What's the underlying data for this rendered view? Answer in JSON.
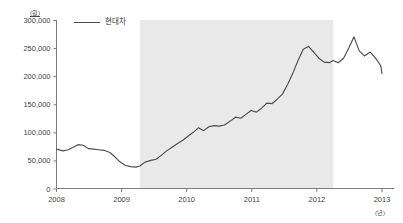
{
  "chart_data": {
    "type": "line",
    "title": "",
    "xlabel": "(년)",
    "ylabel": "(원)",
    "y_unit": "(원)",
    "x_unit": "(년)",
    "xlim": [
      2008.0,
      2013.0
    ],
    "ylim": [
      0,
      300000
    ],
    "grid": false,
    "legend_position": "top-left",
    "legend": [
      "현대차"
    ],
    "y_ticks": [
      0,
      50000,
      100000,
      150000,
      200000,
      250000,
      300000
    ],
    "y_tick_labels": [
      "0",
      "50,000",
      "100,000",
      "150,000",
      "200,000",
      "250,000",
      "300,000"
    ],
    "x_ticks": [
      2008,
      2009,
      2010,
      2011,
      2012,
      2013
    ],
    "x_tick_labels": [
      "2008",
      "2009",
      "2010",
      "2011",
      "2012",
      "2013"
    ],
    "shaded_band": {
      "label": "",
      "x_start": 2009.28,
      "x_end": 2012.25,
      "color": "#e9e9e9"
    },
    "series": [
      {
        "name": "현대차",
        "color": "#4d4d4d",
        "x": [
          2008.0,
          2008.1,
          2008.18,
          2008.25,
          2008.33,
          2008.41,
          2008.49,
          2008.57,
          2008.65,
          2008.73,
          2008.82,
          2008.9,
          2008.98,
          2009.06,
          2009.14,
          2009.22,
          2009.28,
          2009.36,
          2009.45,
          2009.53,
          2009.61,
          2009.69,
          2009.77,
          2009.86,
          2009.94,
          2010.02,
          2010.1,
          2010.18,
          2010.26,
          2010.34,
          2010.42,
          2010.5,
          2010.58,
          2010.67,
          2010.75,
          2010.83,
          2010.91,
          2010.99,
          2011.07,
          2011.15,
          2011.23,
          2011.31,
          2011.39,
          2011.47,
          2011.55,
          2011.63,
          2011.71,
          2011.79,
          2011.87,
          2011.95,
          2012.03,
          2012.11,
          2012.19,
          2012.25,
          2012.33,
          2012.41,
          2012.49,
          2012.57,
          2012.65,
          2012.73,
          2012.82,
          2012.9,
          2012.98,
          2013.0
        ],
        "values": [
          70000,
          67000,
          69000,
          73000,
          78000,
          77000,
          71000,
          70000,
          69000,
          68000,
          64000,
          56000,
          47000,
          41000,
          39000,
          38000,
          40000,
          47000,
          50000,
          52000,
          59000,
          67000,
          73000,
          80000,
          86000,
          93000,
          100000,
          108000,
          103000,
          110000,
          112000,
          111000,
          113000,
          120000,
          127000,
          125000,
          132000,
          139000,
          136000,
          143000,
          152000,
          151000,
          159000,
          168000,
          185000,
          205000,
          228000,
          248000,
          253000,
          243000,
          232000,
          225000,
          224000,
          228000,
          224000,
          232000,
          250000,
          270000,
          245000,
          236000,
          243000,
          232000,
          219000,
          205000
        ]
      }
    ]
  }
}
